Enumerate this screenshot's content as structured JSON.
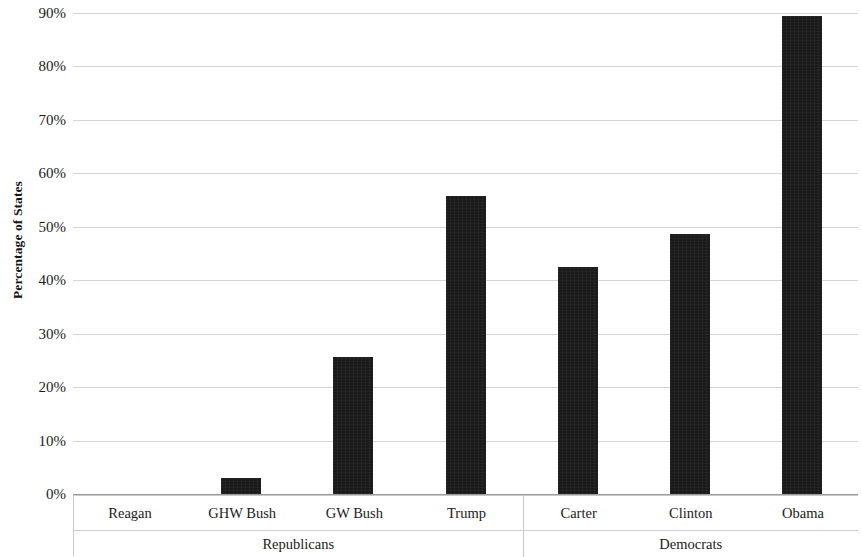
{
  "chart_data": {
    "type": "bar",
    "title": "",
    "xlabel": "",
    "ylabel": "Percentage of States",
    "ylim": [
      0,
      90
    ],
    "ytick_labels": [
      "0%",
      "10%",
      "20%",
      "30%",
      "40%",
      "50%",
      "60%",
      "70%",
      "80%",
      "90%"
    ],
    "ytick_values": [
      0,
      10,
      20,
      30,
      40,
      50,
      60,
      70,
      80,
      90
    ],
    "grid": true,
    "legend": "none",
    "value_suffix": "%",
    "bar_color": "#1a1a1a",
    "gridline_color": "#d4d4d4",
    "categories": [
      "Reagan",
      "GHW Bush",
      "GW Bush",
      "Trump",
      "Carter",
      "Clinton",
      "Obama"
    ],
    "values": [
      0,
      3.0,
      25.7,
      55.7,
      42.5,
      48.7,
      89.4
    ],
    "groups": [
      {
        "label": "Republicans",
        "categories": [
          "Reagan",
          "GHW Bush",
          "GW Bush",
          "Trump"
        ]
      },
      {
        "label": "Democrats",
        "categories": [
          "Carter",
          "Clinton",
          "Obama"
        ]
      }
    ]
  }
}
